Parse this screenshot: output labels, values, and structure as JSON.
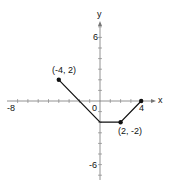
{
  "chart_data": {
    "type": "line",
    "title": "",
    "xlabel": "x",
    "ylabel": "y",
    "xlim": [
      -8,
      4.5
    ],
    "ylim": [
      -7,
      7
    ],
    "x_tick_labels": [
      "-8",
      "0",
      "4"
    ],
    "y_tick_labels": [
      "6",
      "-6"
    ],
    "grid": false,
    "series": [
      {
        "name": "piecewise",
        "points": [
          [
            -4,
            2
          ],
          [
            0,
            -2
          ],
          [
            2,
            -2
          ],
          [
            4,
            0
          ]
        ],
        "endpoints_marked": [
          [
            -4,
            2
          ],
          [
            2,
            -2
          ],
          [
            4,
            0
          ]
        ]
      }
    ],
    "annotations": [
      {
        "text": "(-4, 2)",
        "x": -4,
        "y": 2
      },
      {
        "text": "(2, -2)",
        "x": 2,
        "y": -2
      }
    ]
  },
  "labels": {
    "x_axis": "x",
    "y_axis": "y",
    "tick_neg8": "-8",
    "tick_0": "0",
    "tick_4": "4",
    "tick_6": "6",
    "tick_neg6": "-6",
    "point_a": "(-4, 2)",
    "point_b": "(2, -2)"
  },
  "colors": {
    "line": "#111111",
    "axis": "#555555"
  }
}
